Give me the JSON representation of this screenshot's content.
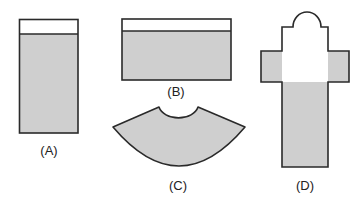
{
  "figure": {
    "colors": {
      "water": "#cfcfcf",
      "outline": "#2a2a2a",
      "empty": "#ffffff"
    },
    "containers": [
      {
        "id": "A",
        "label": "(A)",
        "shape": "tall rectangle",
        "water_level": "nearly full"
      },
      {
        "id": "B",
        "label": "(B)",
        "shape": "wide rectangle",
        "water_level": "nearly full"
      },
      {
        "id": "C",
        "label": "(C)",
        "shape": "annular sector (fan)",
        "water_level": "full"
      },
      {
        "id": "D",
        "label": "(D)",
        "shape": "cross with domed top",
        "water_level": "up to bottom of arms"
      }
    ]
  }
}
